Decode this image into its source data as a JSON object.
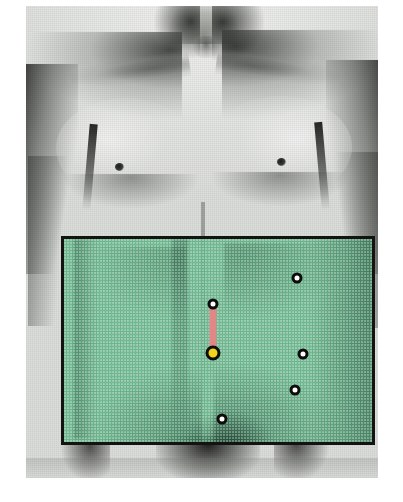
{
  "figure": {
    "caption": "",
    "photo": {
      "type": "halftone-grayscale-photograph",
      "background_color": "#dcdedb",
      "view": "anterior",
      "extent": "neck to groin",
      "landmarks": [
        {
          "name": "neck",
          "label": ""
        },
        {
          "name": "clavicle-left",
          "label": ""
        },
        {
          "name": "clavicle-right",
          "label": ""
        },
        {
          "name": "shoulder-left",
          "label": ""
        },
        {
          "name": "shoulder-right",
          "label": ""
        },
        {
          "name": "pectoralis-left",
          "label": ""
        },
        {
          "name": "pectoralis-right",
          "label": ""
        },
        {
          "name": "nipple-left",
          "label": ""
        },
        {
          "name": "nipple-right",
          "label": ""
        },
        {
          "name": "linea-alba",
          "label": ""
        },
        {
          "name": "umbilicus",
          "label": ""
        },
        {
          "name": "pubic-region",
          "label": ""
        }
      ]
    }
  },
  "overlay": {
    "name": "operative-field-highlight",
    "shape": "rectangle",
    "fill_color": "#65b98b",
    "border_color": "#141512",
    "border_width_px": 3,
    "x": 61,
    "y": 236,
    "width": 314,
    "height": 209,
    "label": ""
  },
  "markers": [
    {
      "id": "marker-upper-midline",
      "type": "port",
      "role": "accessory-port",
      "x": 213,
      "y": 304,
      "diameter_px": 11,
      "fill_color": "#ffffff",
      "outline_color": "#0d0e0c",
      "label": ""
    },
    {
      "id": "marker-camera-umbilical",
      "type": "camera",
      "role": "camera-port",
      "x": 213,
      "y": 353,
      "diameter_px": 15,
      "fill_color": "#f4d51d",
      "outline_color": "#0d0e0c",
      "label": ""
    },
    {
      "id": "marker-upper-right",
      "type": "port",
      "role": "working-port",
      "x": 297,
      "y": 278,
      "diameter_px": 11,
      "fill_color": "#ffffff",
      "outline_color": "#0d0e0c",
      "label": ""
    },
    {
      "id": "marker-mid-right",
      "type": "port",
      "role": "working-port",
      "x": 303,
      "y": 354,
      "diameter_px": 11,
      "fill_color": "#ffffff",
      "outline_color": "#0d0e0c",
      "label": ""
    },
    {
      "id": "marker-lower-right",
      "type": "port",
      "role": "working-port",
      "x": 295,
      "y": 390,
      "diameter_px": 11,
      "fill_color": "#ffffff",
      "outline_color": "#0d0e0c",
      "label": ""
    },
    {
      "id": "marker-lower-midline",
      "type": "port",
      "role": "working-port",
      "x": 222,
      "y": 419,
      "diameter_px": 11,
      "fill_color": "#ffffff",
      "outline_color": "#0d0e0c",
      "label": ""
    }
  ],
  "incision": {
    "id": "midline-incision-line",
    "color": "#e08888",
    "x": 213,
    "y_start": 304,
    "y_end": 353,
    "width_px": 7,
    "label": ""
  },
  "colors": {
    "overlay_green": "#65b98b",
    "incision_pink": "#e08888",
    "camera_yellow": "#f4d51d",
    "marker_outline": "#0d0e0c",
    "photo_paper": "#dcdedb",
    "page_background": "#ffffff"
  }
}
